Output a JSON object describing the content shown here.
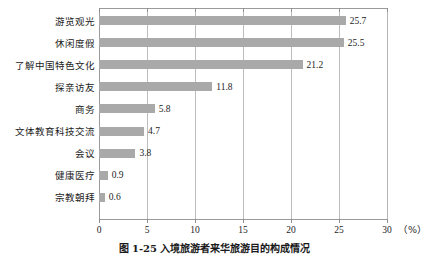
{
  "chart_data": {
    "type": "bar",
    "orientation": "horizontal",
    "title": "",
    "caption": "图 1-25  入境旅游者来华旅游目的构成情况",
    "xlabel": "",
    "ylabel": "",
    "unit_label": "（%）",
    "xlim": [
      0,
      30
    ],
    "xticks": [
      0,
      5,
      10,
      15,
      20,
      25,
      30
    ],
    "xtick_labels": [
      "0",
      "5",
      "10",
      "15",
      "20",
      "25",
      "30"
    ],
    "grid": true,
    "grid_axis": "x",
    "legend": "none",
    "bar_color": "#a9a9a9",
    "categories": [
      "游览观光",
      "休闲度假",
      "了解中国特色文化",
      "探亲访友",
      "商务",
      "文体教育科技交流",
      "会议",
      "健康医疗",
      "宗教朝拜"
    ],
    "values": [
      25.7,
      25.5,
      21.2,
      11.8,
      5.8,
      4.7,
      3.8,
      0.9,
      0.6
    ],
    "value_labels": [
      "25.7",
      "25.5",
      "21.2",
      "11.8",
      "5.8",
      "4.7",
      "3.8",
      "0.9",
      "0.6"
    ]
  }
}
